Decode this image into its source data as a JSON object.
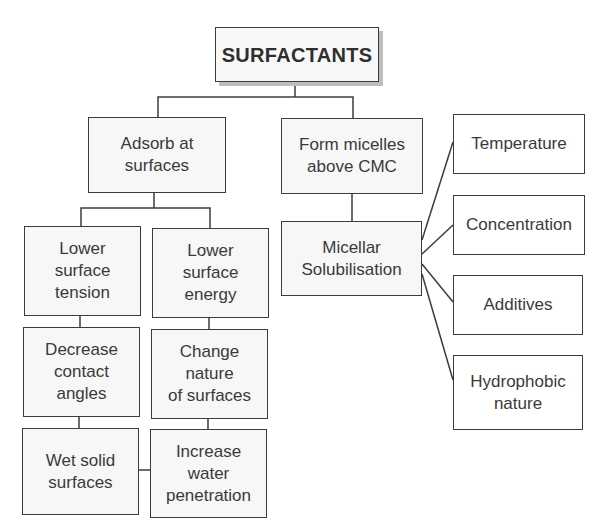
{
  "diagram": {
    "type": "tree",
    "line_color": "#3c3c3c",
    "box_fill": "#f7f7f7",
    "root": {
      "id": "surfactants",
      "label": "SURFACTANTS"
    },
    "nodes": [
      {
        "id": "adsorb",
        "label": "Adsorb at\nsurfaces",
        "parent": "surfactants"
      },
      {
        "id": "micelles",
        "label": "Form micelles\nabove CMC",
        "parent": "surfactants"
      },
      {
        "id": "lower_tension",
        "label": "Lower\nsurface\ntension",
        "parent": "adsorb"
      },
      {
        "id": "lower_energy",
        "label": "Lower\nsurface\nenergy",
        "parent": "adsorb"
      },
      {
        "id": "contact_angles",
        "label": "Decrease\ncontact\nangles",
        "parent": "lower_tension"
      },
      {
        "id": "change_nature",
        "label": "Change\nnature\nof surfaces",
        "parent": "lower_energy"
      },
      {
        "id": "wet_solid",
        "label": "Wet solid\nsurfaces",
        "parent": "contact_angles"
      },
      {
        "id": "water_penetration",
        "label": "Increase\nwater\npenetration",
        "parent": "change_nature"
      },
      {
        "id": "solubilisation",
        "label": "Micellar\nSolubilisation",
        "parent": "micelles"
      },
      {
        "id": "temperature",
        "label": "Temperature",
        "parent": "solubilisation"
      },
      {
        "id": "concentration",
        "label": "Concentration",
        "parent": "solubilisation"
      },
      {
        "id": "additives",
        "label": "Additives",
        "parent": "solubilisation"
      },
      {
        "id": "hydrophobic",
        "label": "Hydrophobic\nnature",
        "parent": "solubilisation"
      }
    ],
    "extra_links": [
      {
        "from": "wet_solid",
        "to": "water_penetration"
      }
    ]
  }
}
